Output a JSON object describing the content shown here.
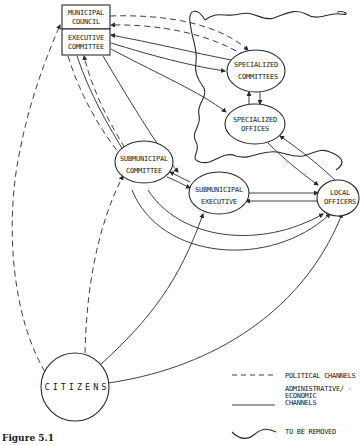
{
  "nodes": {
    "municipal_council": {
      "line1": "MUNICIPAL",
      "line2": "COUNCIL"
    },
    "executive_committee": {
      "line1": "EXECUTIVE",
      "line2": "COMMITTEE"
    },
    "specialized_committees": {
      "line1": "SPECIALIZED",
      "line2": "COMMITTEES"
    },
    "specialized_offices": {
      "line1": "SPECIALIZED",
      "line2": "OFFICES"
    },
    "submunicipal_committee": {
      "line1": "SUBMUNICIPAL",
      "line2": "COMMITTEE"
    },
    "submunicipal_executive": {
      "line1": "SUBMUNICIPAL",
      "line2": "EXECUTIVE"
    },
    "local_officers": {
      "line1": "LOCAL",
      "line2": "OFFICERS"
    },
    "citizens": {
      "label": "CITIZENS"
    }
  },
  "legend": {
    "political": "POLITICAL CHANNELS",
    "administrative_line1": "ADMINISTRATIVE/ -",
    "administrative_line2": "ECONOMIC",
    "administrative_line3": "CHANNELS",
    "removed": "TO BE REMOVED"
  },
  "caption": "Figure 5.1"
}
